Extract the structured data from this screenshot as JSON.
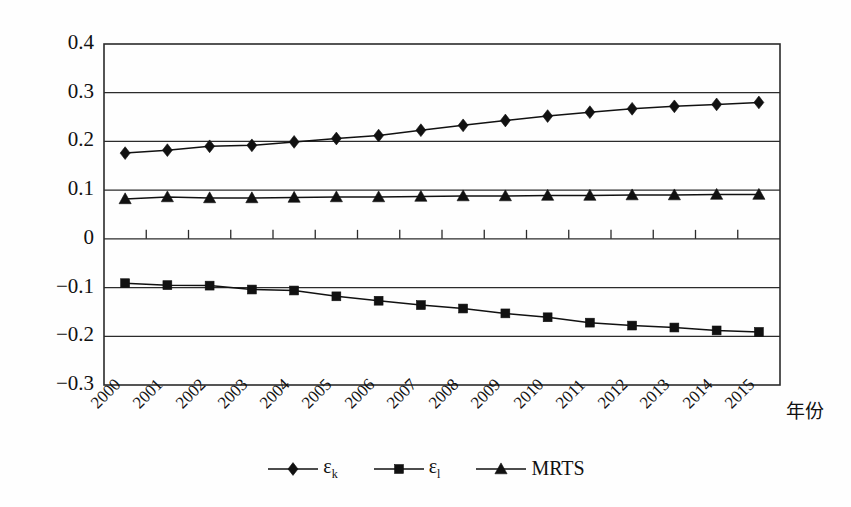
{
  "chart_data": {
    "type": "line",
    "title": "",
    "xlabel": "年份",
    "ylabel": "",
    "categories": [
      "2000",
      "2001",
      "2002",
      "2003",
      "2004",
      "2005",
      "2006",
      "2007",
      "2008",
      "2009",
      "2010",
      "2011",
      "2012",
      "2013",
      "2014",
      "2015"
    ],
    "ylim": [
      -0.3,
      0.4
    ],
    "yticks": [
      "0.4",
      "0.3",
      "0.2",
      "0.1",
      "0",
      "-0.1",
      "-0.2",
      "-0.3"
    ],
    "ytick_values": [
      0.4,
      0.3,
      0.2,
      0.1,
      0,
      -0.1,
      -0.2,
      -0.3
    ],
    "grid": true,
    "legend_position": "bottom",
    "series": [
      {
        "name": "ε_k",
        "label": "ε",
        "sub": "k",
        "marker": "diamond",
        "color": "#111111",
        "values": [
          0.176,
          0.182,
          0.19,
          0.192,
          0.199,
          0.206,
          0.212,
          0.223,
          0.233,
          0.243,
          0.252,
          0.26,
          0.267,
          0.272,
          0.276,
          0.28
        ]
      },
      {
        "name": "ε_l",
        "label": "ε",
        "sub": "l",
        "marker": "square",
        "color": "#111111",
        "values": [
          -0.091,
          -0.095,
          -0.096,
          -0.104,
          -0.106,
          -0.118,
          -0.127,
          -0.136,
          -0.143,
          -0.153,
          -0.161,
          -0.172,
          -0.178,
          -0.182,
          -0.188,
          -0.191
        ]
      },
      {
        "name": "MRTS",
        "label": "MRTS",
        "sub": "",
        "marker": "triangle",
        "color": "#111111",
        "values": [
          0.082,
          0.086,
          0.084,
          0.084,
          0.085,
          0.086,
          0.086,
          0.087,
          0.088,
          0.088,
          0.089,
          0.089,
          0.09,
          0.09,
          0.091,
          0.091
        ]
      }
    ]
  },
  "legend": {
    "items": [
      {
        "text": "ε",
        "sub": "k",
        "marker": "diamond"
      },
      {
        "text": "ε",
        "sub": "l",
        "marker": "square"
      },
      {
        "text": "MRTS",
        "sub": "",
        "marker": "triangle"
      }
    ]
  },
  "axis": {
    "x_title": "年份"
  }
}
